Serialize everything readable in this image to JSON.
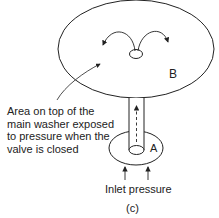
{
  "diagram": {
    "region_b_label": "B",
    "region_a_label": "A",
    "annotation_lines": [
      "Area on top of the",
      "main washer exposed",
      "to pressure when the",
      "valve is closed"
    ],
    "inlet_label": "Inlet pressure",
    "caption": "(c)",
    "colors": {
      "stroke": "#222222",
      "background": "#ffffff"
    }
  }
}
